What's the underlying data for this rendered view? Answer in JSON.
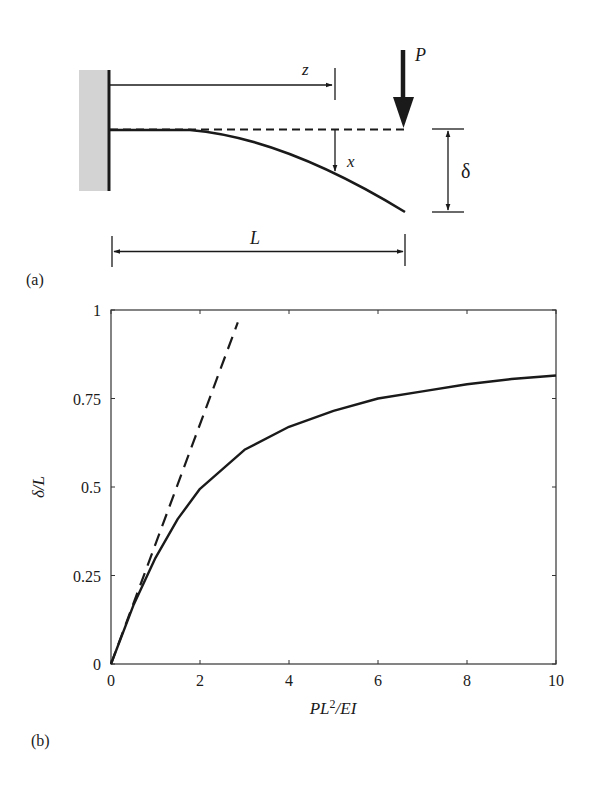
{
  "panel_a": {
    "label": "(a)",
    "load_label": "P",
    "position_label": "z",
    "deflection_label": "x",
    "tip_deflection_label": "δ",
    "length_label": "L",
    "wall_color": "#d3d3d3"
  },
  "panel_b": {
    "label": "(b)"
  },
  "chart_data": {
    "type": "line",
    "title": "",
    "xlabel_parts": [
      "PL",
      "2",
      "/EI"
    ],
    "xlabel": "PL²/EI",
    "ylabel": "δ/L",
    "xlim": [
      0,
      10
    ],
    "ylim": [
      0,
      1
    ],
    "x_ticks": [
      0,
      2,
      4,
      6,
      8,
      10
    ],
    "x_tick_labels": [
      "0",
      "2",
      "4",
      "6",
      "8",
      "10"
    ],
    "y_ticks": [
      0,
      0.25,
      0.5,
      0.75,
      1
    ],
    "y_tick_labels": [
      "0",
      "0.25",
      "0.5",
      "0.75",
      "1"
    ],
    "grid": false,
    "legend": null,
    "mirrored_ticks": true,
    "series": [
      {
        "name": "large-deflection (elastica) solution",
        "style": "solid",
        "x": [
          0,
          0.5,
          1,
          1.5,
          2,
          3,
          4,
          5,
          6,
          7,
          8,
          9,
          10
        ],
        "values": [
          0,
          0.165,
          0.3,
          0.41,
          0.495,
          0.605,
          0.67,
          0.715,
          0.75,
          0.77,
          0.79,
          0.805,
          0.815
        ]
      },
      {
        "name": "linear (small-deflection) theory",
        "style": "dashed",
        "x": [
          0,
          2.85
        ],
        "values": [
          0,
          0.965
        ]
      }
    ]
  }
}
